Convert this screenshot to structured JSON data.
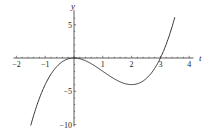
{
  "chart_data": {
    "type": "line",
    "title": "",
    "xlabel": "t",
    "ylabel": "y",
    "function": "y = t^3 - 3t^2",
    "xlim": [
      -2.1,
      4.1
    ],
    "ylim": [
      -10.5,
      7
    ],
    "x_ticks": [
      -2,
      -1,
      1,
      2,
      3,
      4
    ],
    "x_tick_labels": [
      "-2",
      "-1",
      "1",
      "2",
      "3",
      "4"
    ],
    "y_ticks": [
      5,
      -5,
      -10
    ],
    "y_tick_labels": [
      "5",
      "-5",
      "-10"
    ],
    "grid": false,
    "legend": null,
    "series": [
      {
        "name": "curve",
        "color": "#333333",
        "x": [
          -1.5,
          -1.25,
          -1.0,
          -0.75,
          -0.5,
          -0.25,
          0.0,
          0.25,
          0.5,
          0.75,
          1.0,
          1.25,
          1.5,
          1.75,
          2.0,
          2.25,
          2.5,
          2.75,
          3.0,
          3.25,
          3.5
        ],
        "y": [
          -10.125,
          -6.641,
          -4.0,
          -2.109,
          -0.875,
          -0.203,
          0.0,
          -0.172,
          -0.625,
          -1.266,
          -2.0,
          -2.734,
          -3.375,
          -3.828,
          -4.0,
          -3.797,
          -3.125,
          -1.891,
          0.0,
          2.516,
          6.125
        ]
      }
    ]
  }
}
